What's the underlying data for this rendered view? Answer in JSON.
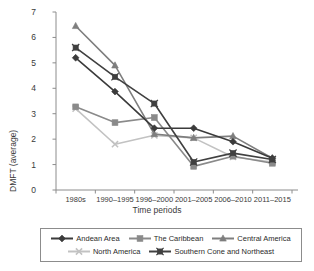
{
  "figure": {
    "caption_remnant": "",
    "background": "#ffffff"
  },
  "chart_data": {
    "type": "line",
    "title": "",
    "xlabel": "Time periods",
    "ylabel": "DMFT (average)",
    "categories": [
      "1980s",
      "1990–1995",
      "1996–2000",
      "2001–2005",
      "2006–2010",
      "2011–2015"
    ],
    "ylim": [
      0,
      7
    ],
    "yticks": [
      0,
      1,
      2,
      3,
      4,
      5,
      6,
      7
    ],
    "grid": false,
    "legend_position": "bottom",
    "series": [
      {
        "name": "Andean Area",
        "marker": "diamond",
        "color": "#3b3b3b",
        "values": [
          5.2,
          3.87,
          2.43,
          2.43,
          1.9,
          1.25
        ]
      },
      {
        "name": "The Caribbean",
        "marker": "square",
        "color": "#8a8a8a",
        "values": [
          3.27,
          2.65,
          2.85,
          0.93,
          1.33,
          1.05
        ]
      },
      {
        "name": "Central America",
        "marker": "triangle",
        "color": "#7e7e7e",
        "values": [
          6.45,
          4.9,
          2.2,
          2.05,
          2.12,
          1.25
        ]
      },
      {
        "name": "North America",
        "marker": "x",
        "color": "#c2c2c2",
        "values": [
          3.2,
          1.8,
          2.15,
          2.05,
          1.3,
          1.1
        ]
      },
      {
        "name": "Southern Cone and Northeast",
        "marker": "x-square",
        "color": "#404040",
        "values": [
          5.6,
          4.45,
          3.4,
          1.1,
          1.45,
          1.2
        ]
      }
    ]
  },
  "axes": {
    "y_tick_labels": [
      "7",
      "6",
      "5",
      "4",
      "3",
      "2",
      "1",
      "0"
    ],
    "x_tick_labels": [
      "1980s",
      "1990–1995",
      "1996–2000",
      "2001–2005",
      "2006–2010",
      "2011–2015"
    ]
  },
  "legend": {
    "row1": [
      "Andean Area",
      "The Caribbean",
      "Central America"
    ],
    "row2": [
      "North America",
      "Southern Cone and Northeast"
    ]
  }
}
